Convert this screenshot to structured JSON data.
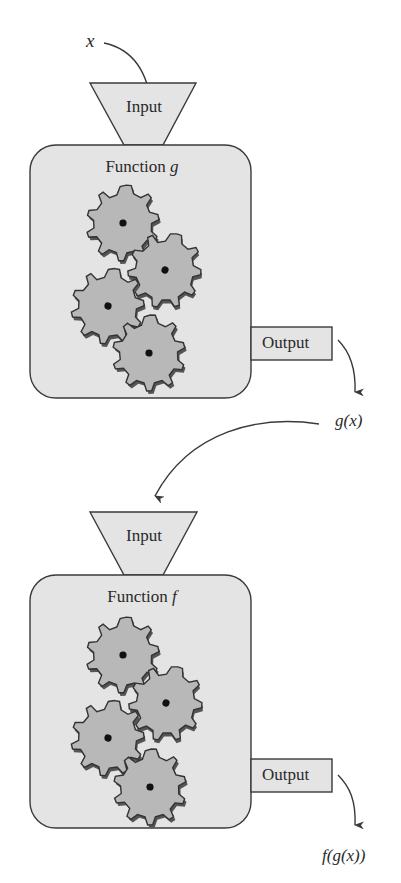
{
  "colors": {
    "box_fill": "#e4e4e4",
    "gear_fill": "#b8b8b8",
    "stroke": "#3a3a3a",
    "text": "#2a2a2a"
  },
  "machines": [
    {
      "id": "g",
      "input_symbol": "x",
      "input_label": "Input",
      "title_prefix": "Function ",
      "title_var": "g",
      "output_label": "Output",
      "output_symbol": "g(x)",
      "gear_count": 4
    },
    {
      "id": "f",
      "input_symbol": "g(x)",
      "input_label": "Input",
      "title_prefix": "Function ",
      "title_var": "f",
      "output_label": "Output",
      "output_symbol": "f(g(x))",
      "gear_count": 4
    }
  ]
}
